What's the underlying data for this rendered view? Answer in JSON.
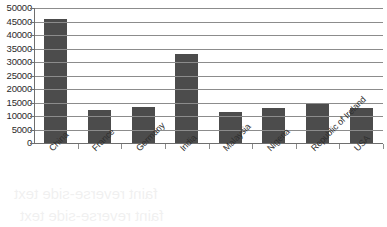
{
  "chart_data": {
    "type": "bar",
    "title": "",
    "xlabel": "",
    "ylabel": "",
    "categories": [
      "China",
      "France",
      "Germany",
      "India",
      "Malaysia",
      "Nigeria",
      "Republic of Ireland",
      "USA"
    ],
    "values": [
      46000,
      12300,
      13200,
      32800,
      11600,
      13100,
      14300,
      12800
    ],
    "ylim": [
      0,
      50000
    ],
    "ytick_labels": [
      "50000",
      "45000",
      "40000",
      "35000",
      "30000",
      "25000",
      "20000",
      "15000",
      "10000",
      "5000",
      "0"
    ],
    "ytick_values": [
      50000,
      45000,
      40000,
      35000,
      30000,
      25000,
      20000,
      15000,
      10000,
      5000,
      0
    ],
    "grid": true,
    "legend": "none",
    "bar_color": "#4c4c4c",
    "gridline_color": "#8c8c8c",
    "axis_color": "#6e6e6e",
    "background_color": "#ffffff",
    "xtick_label_rotation": -45
  },
  "bleed_through": {
    "line1": "faint reverse-side text",
    "line2": "faint reverse-side text"
  }
}
